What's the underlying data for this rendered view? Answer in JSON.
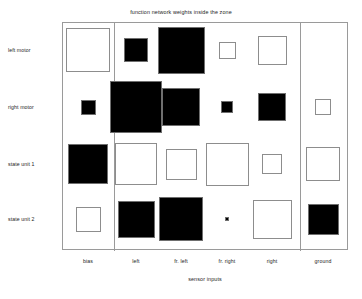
{
  "chart_data": {
    "type": "heatmap",
    "title": "function network weights inside the zone",
    "xlabel": "sensor inputs",
    "ylabel": "",
    "categories": [
      "bias",
      "left",
      "fr. left",
      "fr. right",
      "right",
      "ground"
    ],
    "rows": [
      "left motor",
      "right motor",
      "state unit 1",
      "state unit 2"
    ],
    "grid": false,
    "legend": "none",
    "encoding": "Hinton diagram: square area encodes weight magnitude; white fill = positive weight, black fill = negative weight",
    "colors": {
      "positive_fill": "#ffffff",
      "negative_fill": "#000000",
      "outline": "#8d8d8d",
      "frame": "#9a9a9a",
      "background": "#ffffff",
      "text": "#1c1c1c"
    },
    "column_group_dividers": [
      "after bias",
      "after right"
    ],
    "series": [
      {
        "name": "left motor",
        "values": [
          0.78,
          -0.42,
          -0.86,
          0.3,
          0.52,
          0.0
        ],
        "signs": [
          "positive",
          "negative",
          "negative",
          "positive",
          "positive",
          "none"
        ],
        "magnitudes": [
          0.78,
          0.42,
          0.86,
          0.3,
          0.52,
          0.0
        ]
      },
      {
        "name": "right motor",
        "values": [
          -0.27,
          -0.97,
          -0.7,
          -0.22,
          -0.52,
          0.31
        ],
        "signs": [
          "negative",
          "negative",
          "negative",
          "negative",
          "negative",
          "positive"
        ],
        "magnitudes": [
          0.27,
          0.97,
          0.7,
          0.22,
          0.52,
          0.31
        ]
      },
      {
        "name": "state unit 1",
        "values": [
          -0.73,
          0.76,
          0.57,
          0.8,
          0.37,
          0.63
        ],
        "signs": [
          "negative",
          "positive",
          "positive",
          "positive",
          "positive",
          "positive"
        ],
        "magnitudes": [
          0.73,
          0.76,
          0.57,
          0.8,
          0.37,
          0.63
        ]
      },
      {
        "name": "state unit 2",
        "values": [
          0.45,
          -0.72,
          -0.82,
          -0.06,
          0.68,
          -0.6
        ],
        "signs": [
          "positive",
          "negative",
          "negative",
          "negative",
          "positive",
          "negative"
        ],
        "magnitudes": [
          0.45,
          0.72,
          0.82,
          0.06,
          0.68,
          0.6
        ]
      }
    ],
    "cells": [
      {
        "row": "left motor",
        "col": "bias",
        "sign": "positive",
        "size": 44
      },
      {
        "row": "left motor",
        "col": "left",
        "sign": "negative",
        "size": 24
      },
      {
        "row": "left motor",
        "col": "fr. left",
        "sign": "negative",
        "size": 47
      },
      {
        "row": "left motor",
        "col": "fr. right",
        "sign": "positive",
        "size": 17
      },
      {
        "row": "left motor",
        "col": "right",
        "sign": "positive",
        "size": 29
      },
      {
        "row": "left motor",
        "col": "ground",
        "sign": "none",
        "size": 0
      },
      {
        "row": "right motor",
        "col": "bias",
        "sign": "negative",
        "size": 15
      },
      {
        "row": "right motor",
        "col": "left",
        "sign": "negative",
        "size": 52
      },
      {
        "row": "right motor",
        "col": "fr. left",
        "sign": "negative",
        "size": 38
      },
      {
        "row": "right motor",
        "col": "fr. right",
        "sign": "negative",
        "size": 12
      },
      {
        "row": "right motor",
        "col": "right",
        "sign": "negative",
        "size": 28
      },
      {
        "row": "right motor",
        "col": "ground",
        "sign": "positive",
        "size": 16
      },
      {
        "row": "state unit 1",
        "col": "bias",
        "sign": "negative",
        "size": 40
      },
      {
        "row": "state unit 1",
        "col": "left",
        "sign": "positive",
        "size": 42
      },
      {
        "row": "state unit 1",
        "col": "fr. left",
        "sign": "positive",
        "size": 31
      },
      {
        "row": "state unit 1",
        "col": "fr. right",
        "sign": "positive",
        "size": 43
      },
      {
        "row": "state unit 1",
        "col": "right",
        "sign": "positive",
        "size": 20
      },
      {
        "row": "state unit 1",
        "col": "ground",
        "sign": "positive",
        "size": 34
      },
      {
        "row": "state unit 2",
        "col": "bias",
        "sign": "positive",
        "size": 25
      },
      {
        "row": "state unit 2",
        "col": "left",
        "sign": "negative",
        "size": 37
      },
      {
        "row": "state unit 2",
        "col": "fr. left",
        "sign": "negative",
        "size": 44
      },
      {
        "row": "state unit 2",
        "col": "fr. right",
        "sign": "negative",
        "size": 4
      },
      {
        "row": "state unit 2",
        "col": "right",
        "sign": "positive",
        "size": 39
      },
      {
        "row": "state unit 2",
        "col": "ground",
        "sign": "negative",
        "size": 31
      }
    ]
  },
  "layout": {
    "plot": {
      "left": 62,
      "top": 22,
      "width": 286,
      "height": 228
    },
    "column_centers": [
      88,
      136,
      181,
      227,
      272,
      323
    ],
    "row_centers": [
      50,
      107,
      164,
      219
    ],
    "dividers_x": [
      113,
      299
    ]
  }
}
